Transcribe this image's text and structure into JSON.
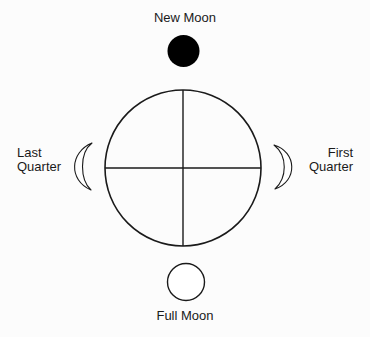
{
  "diagram": {
    "colors": {
      "stroke": "#1a1a1a",
      "new_moon_fill": "#000000",
      "full_moon_fill": "#ffffff",
      "background": "#fcfcfc"
    },
    "phases": {
      "new_moon": {
        "label": "New Moon",
        "position": "top",
        "shape": "filled-disc"
      },
      "first_quarter": {
        "label_line1": "First",
        "label_line2": "Quarter",
        "position": "right",
        "shape": "crescent-right"
      },
      "full_moon": {
        "label": "Full Moon",
        "position": "bottom",
        "shape": "open-circle"
      },
      "last_quarter": {
        "label_line1": "Last",
        "label_line2": "Quarter",
        "position": "left",
        "shape": "crescent-left"
      }
    },
    "orbit": {
      "shape": "circle-with-crosshair"
    }
  }
}
